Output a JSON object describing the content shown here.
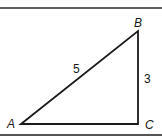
{
  "diagram": {
    "type": "right-triangle",
    "vertices": [
      {
        "label": "A",
        "x": 21,
        "y": 124
      },
      {
        "label": "B",
        "x": 138,
        "y": 31
      },
      {
        "label": "C",
        "x": 138,
        "y": 124
      }
    ],
    "sides": [
      {
        "name": "AB",
        "label": "5"
      },
      {
        "name": "BC",
        "label": "3"
      }
    ],
    "colors": {
      "line": "#1a1a1a",
      "border": "#2a2a2a",
      "background": "#ffffff"
    }
  }
}
